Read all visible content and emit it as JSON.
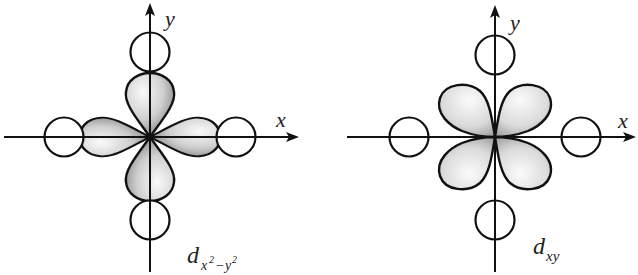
{
  "diagrams": [
    {
      "name": "dx2-y2 orbital",
      "axis_x_label": "x",
      "axis_y_label": "y",
      "orbital_label": "d",
      "orbital_subscript_1": "x",
      "orbital_sup_1": "2",
      "orbital_minus": "−",
      "orbital_subscript_2": "y",
      "orbital_sup_2": "2",
      "lobe_orientation": "along axes"
    },
    {
      "name": "dxy orbital",
      "axis_x_label": "x",
      "axis_y_label": "y",
      "orbital_label": "d",
      "orbital_subscript": "xy",
      "lobe_orientation": "between axes"
    }
  ],
  "colors": {
    "lobe_light": "#f4f4f4",
    "lobe_dark": "#7a7a7a",
    "stroke": "#111111",
    "background": "#ffffff"
  }
}
